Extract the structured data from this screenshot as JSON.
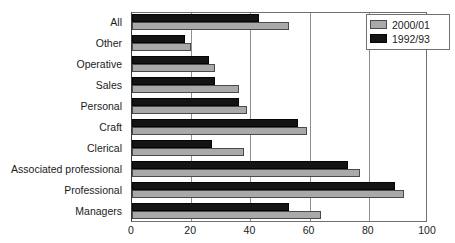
{
  "chart_data": {
    "type": "bar",
    "orientation": "horizontal",
    "title": "",
    "xlabel": "",
    "ylabel": "",
    "xlim": [
      0,
      100
    ],
    "xticks": [
      0,
      20,
      40,
      60,
      80,
      100
    ],
    "grid": true,
    "legend_position": "top-right",
    "categories": [
      "All",
      "Other",
      "Operative",
      "Sales",
      "Personal",
      "Craft",
      "Clerical",
      "Associated professional",
      "Professional",
      "Managers"
    ],
    "series": [
      {
        "name": "2000/01",
        "color": "#a9a9a9",
        "values": [
          53,
          20,
          28,
          36,
          39,
          59,
          38,
          77,
          92,
          64
        ]
      },
      {
        "name": "1992/93",
        "color": "#141414",
        "values": [
          43,
          18,
          26,
          28,
          36,
          56,
          27,
          73,
          89,
          53
        ]
      }
    ]
  },
  "legend": {
    "items": [
      {
        "label": "2000/01",
        "swatch": "new"
      },
      {
        "label": "1992/93",
        "swatch": "old"
      }
    ]
  }
}
